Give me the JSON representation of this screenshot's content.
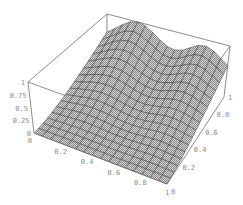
{
  "chart_data": {
    "type": "surface3d",
    "title": "",
    "xlabel": "",
    "ylabel": "",
    "zlabel": "",
    "x_ticks": [
      "0",
      "0.2",
      "0.4",
      "0.6",
      "0.8",
      "1"
    ],
    "y_ticks": [
      "0",
      "0.2",
      "0.4",
      "0.6",
      "0.8",
      "1"
    ],
    "z_ticks": [
      "0",
      "0.25",
      "0.5",
      "0.75",
      "1"
    ],
    "xlim": [
      0,
      1
    ],
    "ylim": [
      0,
      1
    ],
    "zlim": [
      0,
      1
    ],
    "grid_resolution": 16,
    "surface_description": "Flat near 0 along y=0; rises toward y=1 with two peaks along the back edge: ~1.0 near x=0.25 and ~0.9 near x=0.8, with a saddle ~0.75 between them.",
    "sample_values": [
      {
        "x": 0.0,
        "y": 0.0,
        "z": 0.0
      },
      {
        "x": 1.0,
        "y": 0.0,
        "z": 0.0
      },
      {
        "x": 0.0,
        "y": 1.0,
        "z": 0.55
      },
      {
        "x": 0.25,
        "y": 1.0,
        "z": 1.0
      },
      {
        "x": 0.55,
        "y": 1.0,
        "z": 0.75
      },
      {
        "x": 0.8,
        "y": 1.0,
        "z": 0.9
      },
      {
        "x": 1.0,
        "y": 1.0,
        "z": 0.6
      },
      {
        "x": 0.5,
        "y": 0.5,
        "z": 0.25
      }
    ],
    "colors": {
      "surface_fill": "#b4b4b4",
      "mesh_lines": "#2e2e2e",
      "box_lines": "#6e6e6e",
      "tick_labels": "#8a8a8a",
      "background": "#ffffff"
    }
  }
}
